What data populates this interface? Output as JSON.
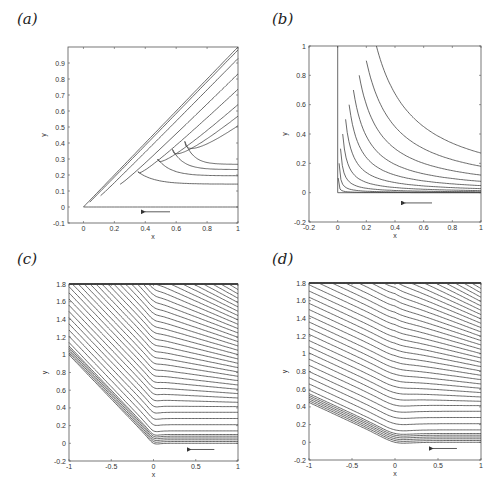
{
  "figure": {
    "panels": [
      {
        "id": "a",
        "label": "(a)",
        "xlabel": "x",
        "ylabel": "y",
        "xticks": [
          "0",
          "0.2",
          "0.4",
          "0.6",
          "0.8",
          "1"
        ],
        "yticks": [
          "-0.1",
          "0",
          "0.1",
          "0.2",
          "0.3",
          "0.4",
          "0.5",
          "0.6",
          "0.7",
          "0.8",
          "0.9"
        ]
      },
      {
        "id": "b",
        "label": "(b)",
        "xlabel": "x",
        "ylabel": "y",
        "xticks": [
          "-0.2",
          "0",
          "0.2",
          "0.4",
          "0.6",
          "0.8",
          "1"
        ],
        "yticks": [
          "-0.2",
          "0",
          "0.2",
          "0.4",
          "0.6",
          "0.8",
          "1"
        ]
      },
      {
        "id": "c",
        "label": "(c)",
        "xlabel": "x",
        "ylabel": "y",
        "xticks": [
          "-1",
          "-0.5",
          "0",
          "0.5",
          "1"
        ],
        "yticks": [
          "-0.2",
          "0",
          "0.2",
          "0.4",
          "0.6",
          "0.8",
          "1",
          "1.2",
          "1.4",
          "1.6",
          "1.8"
        ]
      },
      {
        "id": "d",
        "label": "(d)",
        "xlabel": "x",
        "ylabel": "y",
        "xticks": [
          "-1",
          "-0.5",
          "0",
          "0.5",
          "1"
        ],
        "yticks": [
          "-0.2",
          "0",
          "0.2",
          "0.4",
          "0.6",
          "0.8",
          "1",
          "1.2",
          "1.4",
          "1.6",
          "1.8"
        ]
      }
    ]
  },
  "chart_data": [
    {
      "type": "line",
      "panel": "a",
      "title": "",
      "xlabel": "x",
      "ylabel": "y",
      "xlim": [
        -0.1,
        1
      ],
      "ylim": [
        -0.1,
        1
      ],
      "grid": false,
      "description": "Nested wedge-shaped streamlines bounded by diagonal y=x and y=0, flow direction leftward (arrow near y=-0.03)"
    },
    {
      "type": "line",
      "panel": "b",
      "title": "",
      "xlabel": "x",
      "ylabel": "y",
      "xlim": [
        -0.2,
        1
      ],
      "ylim": [
        -0.2,
        1
      ],
      "grid": false,
      "description": "Corner-flow hyperbolic streamlines in first quadrant, flow leftward (arrow near y=-0.1)"
    },
    {
      "type": "line",
      "panel": "c",
      "title": "",
      "xlabel": "x",
      "ylabel": "y",
      "xlim": [
        -1,
        1
      ],
      "ylim": [
        -0.2,
        1.8
      ],
      "grid": false,
      "description": "Streamlines horizontal for x>0 bending to slope -1 lines for x<0, flow leftward"
    },
    {
      "type": "line",
      "panel": "d",
      "title": "",
      "xlabel": "x",
      "ylabel": "y",
      "xlim": [
        -1,
        1
      ],
      "ylim": [
        -0.2,
        1.8
      ],
      "grid": false,
      "description": "Streamlines horizontal for x>0 bending smoothly to gentler negative slope for x<0, flow leftward"
    }
  ]
}
